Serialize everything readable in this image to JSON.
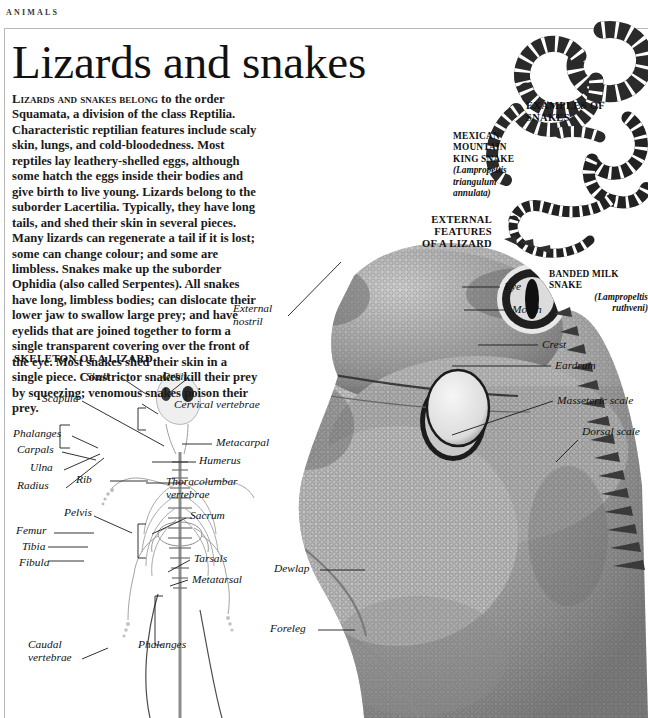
{
  "page": {
    "running_head": "ANIMALS",
    "title": "Lizards and snakes",
    "background_color": "#ffffff",
    "ink_color": "#111111",
    "rule_color": "#b9b9b9"
  },
  "intro": {
    "lead_small_caps": "LIZARDS AND SNAKES BELONG",
    "body": "LIZARDS AND SNAKES BELONG to the order Squamata, a division of the class Reptilia. Characteristic reptilian features include scaly skin, lungs, and cold-bloodedness. Most reptiles lay leathery-shelled eggs, although some hatch the eggs inside their bodies and give birth to live young. Lizards belong to the suborder Lacertilia. Typically, they have long tails, and shed their skin in several pieces. Many lizards can regenerate a tail if it is lost; some can change colour; and some are limbless. Snakes make up the suborder Ophidia (also called Serpentes). All snakes have long, limbless bodies; can dislocate their lower jaw to swallow large prey; and have eyelids that are joined together to form a single transparent covering over the front of the eye. Most snakes shed their skin in a single piece. Constrictor snakes kill their prey by squeezing; venomous snakes poison their prey."
  },
  "headings": {
    "skeleton": "SKELETON OF A LIZARD",
    "external_features_line1": "EXTERNAL FEATURES",
    "external_features_line2": "OF A LIZARD",
    "examples_line1": "EXAMPLES OF",
    "examples_line2": "SNAKES"
  },
  "species": [
    {
      "name": "mexican-mountain-king-snake",
      "common_line1": "MEXICAN",
      "common_line2": "MOUNTAIN",
      "common_line3": "KING SNAKE",
      "latin_line1": "(Lampropeltis",
      "latin_line2": "triangulum",
      "latin_line3": "annulata)"
    },
    {
      "name": "banded-milk-snake",
      "common_line1": "BANDED MILK",
      "common_line2": "SNAKE",
      "latin_line1": "(Lampropeltis",
      "latin_line2": "ruthveni)"
    }
  ],
  "skeleton_labels": [
    {
      "id": "skull",
      "text": "Skull"
    },
    {
      "id": "orbit",
      "text": "Orbit"
    },
    {
      "id": "scapula",
      "text": "Scapula"
    },
    {
      "id": "cervical-vertebrae",
      "text": "Cervical vertebrae"
    },
    {
      "id": "phalanges-fore",
      "text": "Phalanges"
    },
    {
      "id": "carpals",
      "text": "Carpals"
    },
    {
      "id": "metacarpal",
      "text": "Metacarpal"
    },
    {
      "id": "ulna",
      "text": "Ulna"
    },
    {
      "id": "humerus",
      "text": "Humerus"
    },
    {
      "id": "radius",
      "text": "Radius"
    },
    {
      "id": "rib",
      "text": "Rib"
    },
    {
      "id": "thoracolumbar-vertebrae",
      "text": "Thoracolumbar\nvertebrae"
    },
    {
      "id": "pelvis",
      "text": "Pelvis"
    },
    {
      "id": "sacrum",
      "text": "Sacrum"
    },
    {
      "id": "femur",
      "text": "Femur"
    },
    {
      "id": "tibia",
      "text": "Tibia"
    },
    {
      "id": "fibula",
      "text": "Fibula"
    },
    {
      "id": "tarsals",
      "text": "Tarsals"
    },
    {
      "id": "metatarsal",
      "text": "Metatarsal"
    },
    {
      "id": "caudal-vertebrae",
      "text": "Caudal\nvertebrae"
    },
    {
      "id": "phalanges-hind",
      "text": "Phalanges"
    }
  ],
  "lizard_labels": [
    {
      "id": "external-nostril",
      "text": "External\nnostril"
    },
    {
      "id": "eye",
      "text": "Eye"
    },
    {
      "id": "mouth",
      "text": "Mouth"
    },
    {
      "id": "crest",
      "text": "Crest"
    },
    {
      "id": "eardrum",
      "text": "Eardrum"
    },
    {
      "id": "masseteric-scale",
      "text": "Masseteric scale"
    },
    {
      "id": "dorsal-scale",
      "text": "Dorsal scale"
    },
    {
      "id": "dewlap",
      "text": "Dewlap"
    },
    {
      "id": "foreleg",
      "text": "Foreleg"
    }
  ]
}
